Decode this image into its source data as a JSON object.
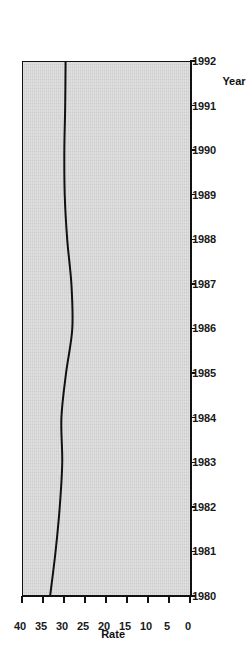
{
  "chart_data": {
    "type": "line",
    "title": "",
    "xlabel": "Year",
    "ylabel": "Rate",
    "xlim": [
      1980,
      1992
    ],
    "ylim": [
      0,
      40
    ],
    "grid": false,
    "legend": null,
    "x_ticks": [
      "1980",
      "1981",
      "1982",
      "1983",
      "1984",
      "1985",
      "1986",
      "1987",
      "1988",
      "1989",
      "1990",
      "1991",
      "1992"
    ],
    "y_ticks": [
      "0",
      "5",
      "10",
      "15",
      "20",
      "25",
      "30",
      "35",
      "40"
    ],
    "x": [
      1980,
      1981,
      1982,
      1983,
      1984,
      1985,
      1986,
      1987,
      1988,
      1989,
      1990,
      1991,
      1992
    ],
    "values": [
      33.5,
      32.2,
      31.2,
      30.6,
      30.8,
      29.7,
      28.2,
      28.4,
      29.4,
      30.0,
      30.1,
      29.9,
      29.8
    ],
    "series": [
      {
        "name": "Rate",
        "color": "#111111",
        "values": [
          33.5,
          32.2,
          31.2,
          30.6,
          30.8,
          29.7,
          28.2,
          28.4,
          29.4,
          30.0,
          30.1,
          29.9,
          29.8
        ]
      }
    ],
    "plot_background": "#d4d4d4",
    "line_color": "#111111",
    "line_width": 2
  }
}
